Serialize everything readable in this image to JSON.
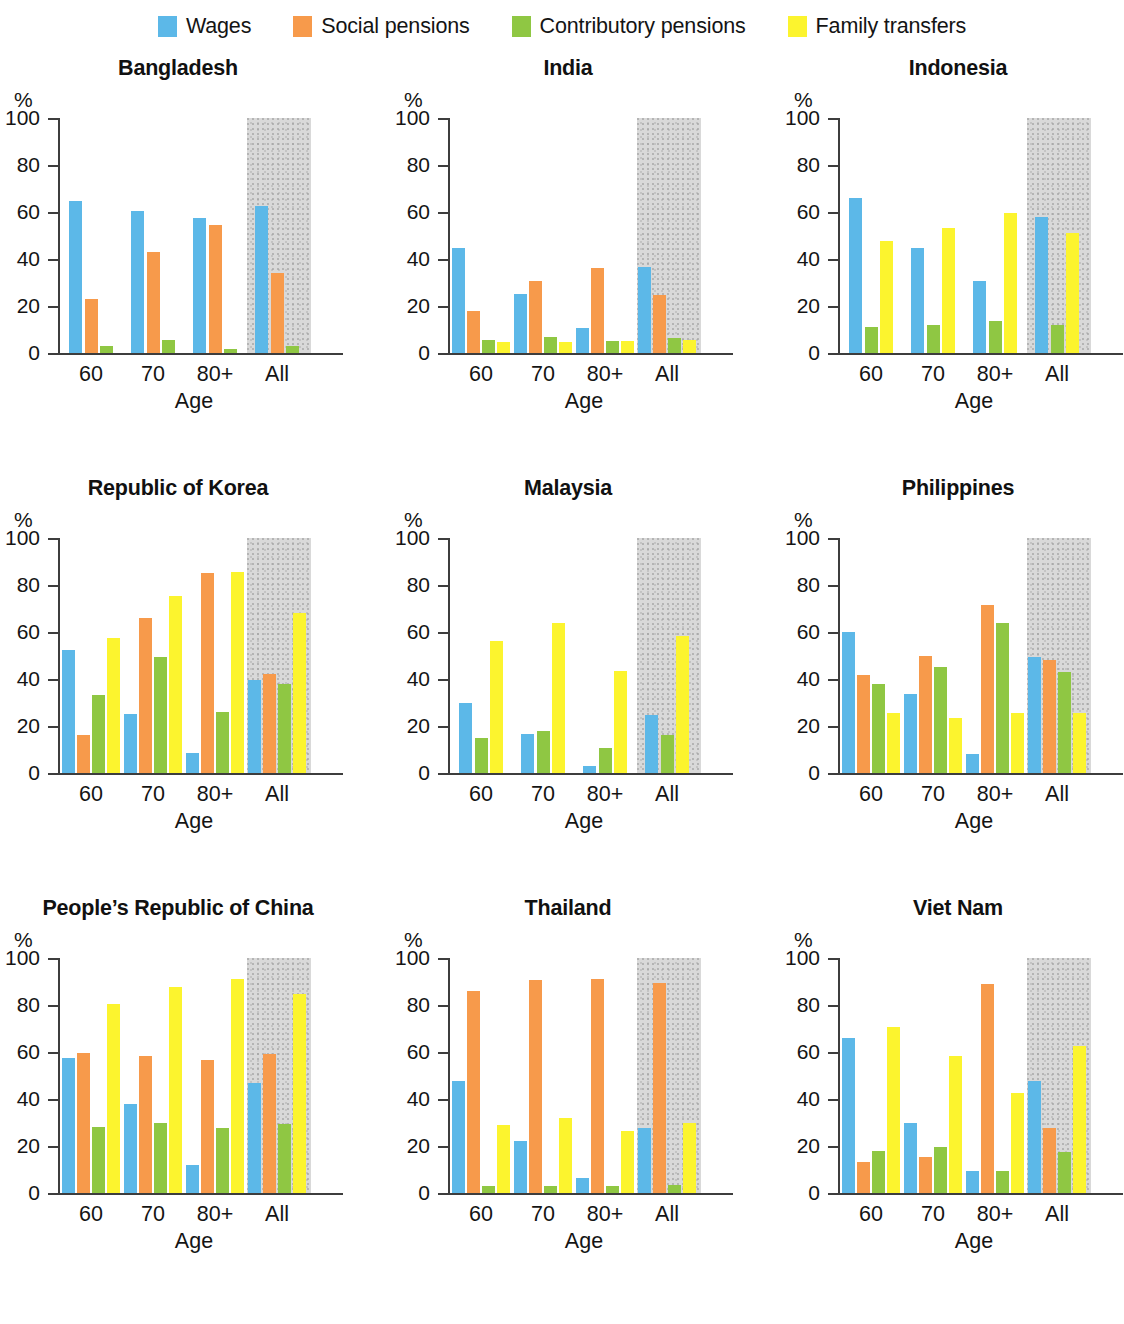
{
  "legend": {
    "items": [
      {
        "label": "Wages",
        "color": "#5cb8e8",
        "key": "wages"
      },
      {
        "label": "Social pensions",
        "color": "#f79a4b",
        "key": "social"
      },
      {
        "label": "Contributory pensions",
        "color": "#8fc743",
        "key": "contributory"
      },
      {
        "label": "Family transfers",
        "color": "#fcf42e",
        "key": "family"
      }
    ]
  },
  "axis": {
    "y_unit": "%",
    "y_ticks": [
      100,
      80,
      60,
      40,
      20,
      0
    ],
    "x_label": "Age",
    "x_categories": [
      "60",
      "70",
      "80+",
      "All"
    ],
    "highlight_category": "All",
    "highlight_color": "#d9d9d9",
    "ylim": [
      0,
      100
    ]
  },
  "chart_data": {
    "type": "bar",
    "title": "",
    "xlabel": "Age",
    "ylabel": "%",
    "ylim": [
      0,
      100
    ],
    "grid": false,
    "legend_position": "top-center",
    "categories": [
      "60",
      "70",
      "80+",
      "All"
    ],
    "series_names": [
      "Wages",
      "Social pensions",
      "Contributory pensions",
      "Family transfers"
    ],
    "panels": [
      {
        "name": "Bangladesh",
        "series": [
          {
            "name": "Wages",
            "values": [
              64.5,
              60.5,
              57.5,
              62.5
            ]
          },
          {
            "name": "Social pensions",
            "values": [
              23.0,
              43.0,
              54.5,
              34.0
            ]
          },
          {
            "name": "Contributory pensions",
            "values": [
              3.0,
              5.5,
              1.5,
              3.0
            ]
          },
          {
            "name": "Family transfers",
            "values": [
              0,
              0,
              0,
              0
            ]
          }
        ]
      },
      {
        "name": "India",
        "series": [
          {
            "name": "Wages",
            "values": [
              44.5,
              25.0,
              10.5,
              36.5
            ]
          },
          {
            "name": "Social pensions",
            "values": [
              18.0,
              30.5,
              36.0,
              24.5
            ]
          },
          {
            "name": "Contributory pensions",
            "values": [
              5.5,
              7.0,
              5.0,
              6.5
            ]
          },
          {
            "name": "Family transfers",
            "values": [
              4.5,
              4.5,
              5.0,
              5.5
            ]
          }
        ]
      },
      {
        "name": "Indonesia",
        "series": [
          {
            "name": "Wages",
            "values": [
              66.0,
              44.5,
              30.5,
              58.0
            ]
          },
          {
            "name": "Social pensions",
            "values": [
              0,
              0,
              0,
              0
            ]
          },
          {
            "name": "Contributory pensions",
            "values": [
              11.0,
              12.0,
              13.5,
              12.0
            ]
          },
          {
            "name": "Family transfers",
            "values": [
              47.5,
              53.0,
              59.5,
              51.0
            ]
          }
        ]
      },
      {
        "name": "Republic of Korea",
        "series": [
          {
            "name": "Wages",
            "values": [
              52.5,
              25.0,
              8.5,
              39.5
            ]
          },
          {
            "name": "Social pensions",
            "values": [
              16.0,
              66.0,
              85.0,
              42.0
            ]
          },
          {
            "name": "Contributory pensions",
            "values": [
              33.0,
              49.5,
              26.0,
              38.0
            ]
          },
          {
            "name": "Family transfers",
            "values": [
              57.5,
              75.5,
              85.5,
              68.0
            ]
          }
        ]
      },
      {
        "name": "Malaysia",
        "series": [
          {
            "name": "Wages",
            "values": [
              30.0,
              16.5,
              3.0,
              24.5
            ]
          },
          {
            "name": "Social pensions",
            "values": [
              0,
              0,
              0,
              0
            ]
          },
          {
            "name": "Contributory pensions",
            "values": [
              15.0,
              18.0,
              10.5,
              16.0
            ]
          },
          {
            "name": "Family transfers",
            "values": [
              56.0,
              64.0,
              43.5,
              58.5
            ]
          }
        ]
      },
      {
        "name": "Philippines",
        "series": [
          {
            "name": "Wages",
            "values": [
              60.0,
              33.5,
              8.0,
              49.5
            ]
          },
          {
            "name": "Social pensions",
            "values": [
              41.5,
              50.0,
              71.5,
              48.0
            ]
          },
          {
            "name": "Contributory pensions",
            "values": [
              38.0,
              45.0,
              64.0,
              43.0
            ]
          },
          {
            "name": "Family transfers",
            "values": [
              25.5,
              23.5,
              25.5,
              25.5
            ]
          }
        ]
      },
      {
        "name": "People’s Republic of China",
        "series": [
          {
            "name": "Wages",
            "values": [
              57.5,
              38.0,
              12.0,
              47.0
            ]
          },
          {
            "name": "Social pensions",
            "values": [
              59.5,
              58.5,
              56.5,
              59.0
            ]
          },
          {
            "name": "Contributory pensions",
            "values": [
              28.0,
              30.0,
              27.5,
              29.5
            ]
          },
          {
            "name": "Family transfers",
            "values": [
              80.5,
              87.5,
              91.0,
              84.5
            ]
          }
        ]
      },
      {
        "name": "Thailand",
        "series": [
          {
            "name": "Wages",
            "values": [
              47.5,
              22.0,
              6.5,
              27.5
            ]
          },
          {
            "name": "Social pensions",
            "values": [
              86.0,
              90.5,
              91.0,
              89.5
            ]
          },
          {
            "name": "Contributory pensions",
            "values": [
              3.0,
              3.0,
              3.0,
              3.5
            ]
          },
          {
            "name": "Family transfers",
            "values": [
              29.0,
              32.0,
              26.5,
              30.0
            ]
          }
        ]
      },
      {
        "name": "Viet Nam",
        "series": [
          {
            "name": "Wages",
            "values": [
              66.0,
              30.0,
              9.5,
              47.5
            ]
          },
          {
            "name": "Social pensions",
            "values": [
              13.0,
              15.5,
              89.0,
              27.5
            ]
          },
          {
            "name": "Contributory pensions",
            "values": [
              18.0,
              19.5,
              9.5,
              17.5
            ]
          },
          {
            "name": "Family transfers",
            "values": [
              70.5,
              58.5,
              42.5,
              62.5
            ]
          }
        ]
      }
    ]
  }
}
